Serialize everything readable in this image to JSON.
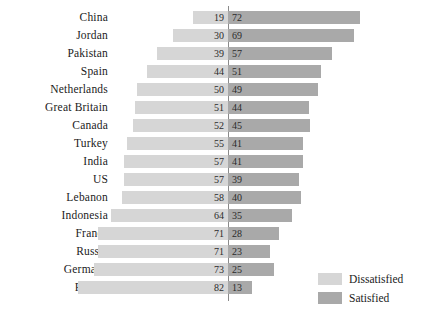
{
  "chart_data": {
    "type": "bar",
    "subtype": "diverging-stacked-bar",
    "title": "",
    "xlabel": "",
    "ylabel": "",
    "categories": [
      "China",
      "Jordan",
      "Pakistan",
      "Spain",
      "Netherlands",
      "Great Britain",
      "Canada",
      "Turkey",
      "India",
      "US",
      "Lebanon",
      "Indonesia",
      "France",
      "Russia",
      "Germany",
      "Poland"
    ],
    "series": [
      {
        "name": "Dissatisfied",
        "color": "#d6d6d6",
        "values": [
          19,
          30,
          39,
          44,
          50,
          51,
          52,
          55,
          57,
          57,
          58,
          64,
          71,
          71,
          73,
          82
        ]
      },
      {
        "name": "Satisfied",
        "color": "#a9a9a9",
        "values": [
          72,
          69,
          57,
          51,
          49,
          44,
          45,
          41,
          41,
          39,
          40,
          35,
          28,
          23,
          25,
          13
        ]
      }
    ],
    "legend": {
      "position": "bottom-right",
      "entries": [
        "Dissatisfied",
        "Satisfied"
      ]
    },
    "grid": false,
    "axis_center": 0,
    "value_labels": true
  },
  "legend": {
    "items": [
      {
        "label": "Dissatisfied",
        "swatch": "light"
      },
      {
        "label": "Satisfied",
        "swatch": "dark"
      }
    ]
  }
}
